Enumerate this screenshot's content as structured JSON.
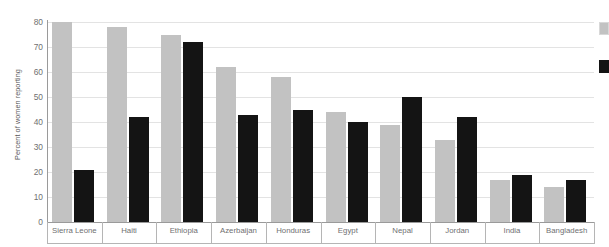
{
  "chart_data": {
    "type": "bar",
    "title": "",
    "subtitle": "",
    "xlabel": "",
    "ylabel": "Percent of women reporting",
    "ylim": [
      0,
      80
    ],
    "yticks": [
      0,
      10,
      20,
      30,
      40,
      50,
      60,
      70,
      80
    ],
    "grid": true,
    "legend_position": "right",
    "categories": [
      "Sierra Leone",
      "Haiti",
      "Ethiopia",
      "Azerbaijan",
      "Honduras",
      "Egypt",
      "Nepal",
      "Jordan",
      "India",
      "Bangladesh"
    ],
    "series": [
      {
        "name": "",
        "color": "#c2c2c2",
        "values": [
          80,
          78,
          75,
          62,
          58,
          44,
          39,
          33,
          17,
          14
        ]
      },
      {
        "name": "",
        "color": "#141414",
        "values": [
          21,
          42,
          72,
          43,
          45,
          40,
          50,
          42,
          19,
          17
        ]
      }
    ]
  },
  "legend": {
    "entries": [
      {
        "swatch": "series-1-swatch",
        "label": ""
      },
      {
        "swatch": "series-2-swatch",
        "label": ""
      }
    ]
  }
}
